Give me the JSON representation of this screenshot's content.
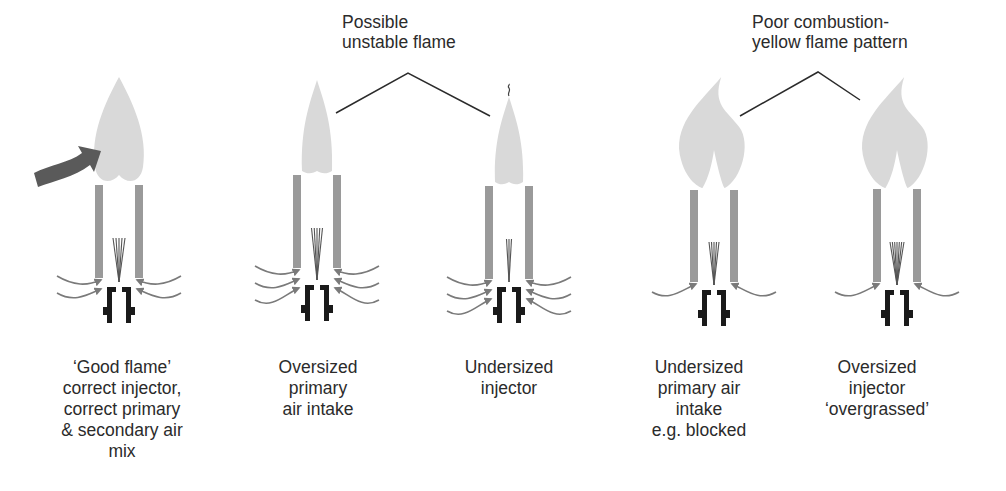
{
  "colors": {
    "background": "#ffffff",
    "flame": "#d9d9d9",
    "tube": "#9a9a9a",
    "jet": "#555555",
    "injector": "#1a1a1a",
    "air_arrow": "#7a7a7a",
    "secondary_air_arrow": "#5a5a5a",
    "callout_line": "#2b2b2b",
    "text": "#2b2b2b"
  },
  "callouts": [
    {
      "id": "unstable",
      "lines": [
        "Possible",
        "unstable flame"
      ],
      "text_x": 342,
      "text_y": 12,
      "pointer": [
        [
          336,
          113
        ],
        [
          408,
          73
        ],
        [
          490,
          116
        ]
      ]
    },
    {
      "id": "poor-combustion",
      "lines": [
        "Poor combustion-",
        "yellow flame pattern"
      ],
      "text_x": 752,
      "text_y": 12,
      "pointer": [
        [
          740,
          116
        ],
        [
          818,
          72
        ],
        [
          860,
          100
        ]
      ]
    }
  ],
  "burners": [
    {
      "id": "good-flame",
      "cx": 119,
      "flame": {
        "type": "double",
        "top": 77,
        "bottom": 183,
        "half_width": 24
      },
      "tube_top": 185,
      "tube_bottom": 278,
      "jets": 5,
      "jet_spread": 12,
      "injector_top": 287,
      "air_arrows": 2,
      "secondary_arrow": true,
      "caption": [
        "‘Good flame’",
        "correct injector,",
        "correct primary",
        "& secondary air",
        "mix"
      ],
      "caption_x": 122
    },
    {
      "id": "oversized-primary-air",
      "cx": 317,
      "flame": {
        "type": "slim",
        "top": 80,
        "bottom": 175,
        "half_width": 15
      },
      "tube_top": 175,
      "tube_bottom": 268,
      "jets": 5,
      "jet_spread": 11,
      "injector_top": 285,
      "air_arrows": 3,
      "secondary_arrow": false,
      "caption": [
        "Oversized",
        "primary",
        "air intake"
      ],
      "caption_x": 318
    },
    {
      "id": "undersized-injector",
      "cx": 509,
      "flame": {
        "type": "slim-wisp",
        "top": 97,
        "bottom": 186,
        "half_width": 14
      },
      "tube_top": 186,
      "tube_bottom": 279,
      "jets": 3,
      "jet_spread": 5,
      "injector_top": 287,
      "air_arrows": 3,
      "secondary_arrow": false,
      "caption": [
        "Undersized",
        "injector"
      ],
      "caption_x": 509
    },
    {
      "id": "undersized-primary-air",
      "cx": 714,
      "flame": {
        "type": "lazy",
        "top": 77,
        "bottom": 188,
        "half_width": 36
      },
      "tube_top": 190,
      "tube_bottom": 282,
      "jets": 5,
      "jet_spread": 10,
      "injector_top": 290,
      "air_arrows": 1,
      "secondary_arrow": false,
      "caption": [
        "Undersized",
        "primary air",
        "intake",
        "e.g. blocked"
      ],
      "caption_x": 699
    },
    {
      "id": "oversized-injector",
      "cx": 897,
      "flame": {
        "type": "lazy",
        "top": 77,
        "bottom": 188,
        "half_width": 36
      },
      "tube_top": 189,
      "tube_bottom": 282,
      "jets": 7,
      "jet_spread": 14,
      "injector_top": 290,
      "air_arrows": 1,
      "secondary_arrow": false,
      "caption": [
        "Oversized",
        "injector",
        "‘overgrassed’"
      ],
      "caption_x": 877
    }
  ],
  "captions_top": 357
}
